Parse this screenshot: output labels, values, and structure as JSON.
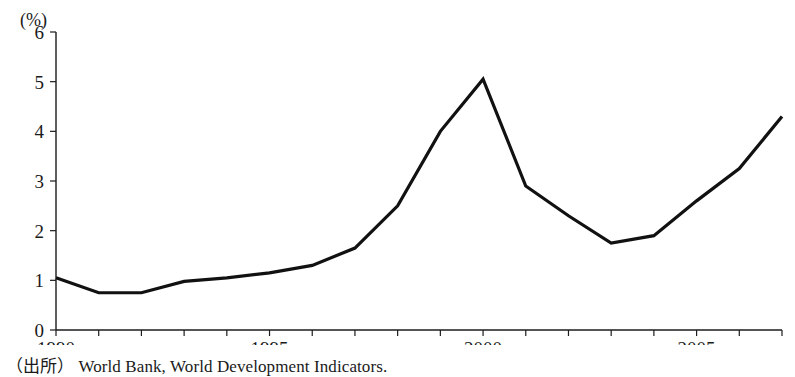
{
  "chart_data": {
    "type": "line",
    "title": "",
    "subtitle": "",
    "xlabel": "",
    "ylabel": "",
    "unit_label": "(%)",
    "x": [
      1990,
      1991,
      1992,
      1993,
      1994,
      1995,
      1996,
      1997,
      1998,
      1999,
      2000,
      2001,
      2002,
      2003,
      2004,
      2005,
      2006,
      2007
    ],
    "values": [
      1.05,
      0.75,
      0.75,
      0.98,
      1.05,
      1.15,
      1.3,
      1.65,
      2.5,
      4.0,
      5.05,
      2.9,
      2.3,
      1.75,
      1.9,
      2.6,
      3.25,
      4.3
    ],
    "series": [
      {
        "name": "",
        "values": [
          1.05,
          0.75,
          0.75,
          0.98,
          1.05,
          1.15,
          1.3,
          1.65,
          2.5,
          4.0,
          5.05,
          2.9,
          2.3,
          1.75,
          1.9,
          2.6,
          3.25,
          4.3
        ],
        "color": "#111111"
      }
    ],
    "xlim": [
      1990,
      2007
    ],
    "ylim": [
      0,
      6
    ],
    "y_ticks": [
      0,
      1,
      2,
      3,
      4,
      5,
      6
    ],
    "y_tick_labels": [
      "0",
      "1",
      "2",
      "3",
      "4",
      "5",
      "6"
    ],
    "x_ticks": [
      1990,
      1991,
      1992,
      1993,
      1994,
      1995,
      1996,
      1997,
      1998,
      1999,
      2000,
      2001,
      2002,
      2003,
      2004,
      2005,
      2006,
      2007
    ],
    "x_tick_labels": [
      "1990",
      "",
      "",
      "",
      "",
      "1995",
      "",
      "",
      "",
      "",
      "2000",
      "",
      "",
      "",
      "",
      "2005",
      "",
      ""
    ],
    "grid": false,
    "legend": "none",
    "line_color": "#111111",
    "axis_color": "#1c1c1c"
  },
  "source": {
    "prefix": "（出所）",
    "text": "World Bank, World Development Indicators."
  }
}
